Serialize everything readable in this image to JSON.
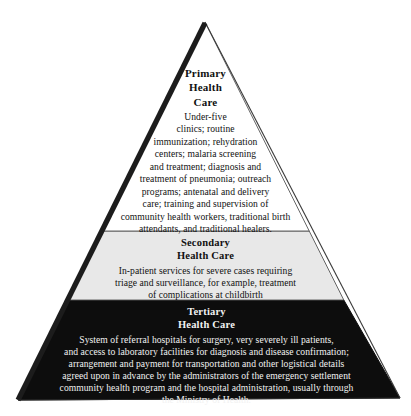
{
  "figure": {
    "name": "health-care-pyramid",
    "shape": "triangle-pyramid",
    "colors": {
      "primary_band_fill": "#ffffff",
      "secondary_band_fill": "#e8e8e8",
      "tertiary_band_fill": "#0d0d0d",
      "outline": "#3a3a3a",
      "left_edge_shadow": "#1a1a1a",
      "primary_text": "#111111",
      "secondary_text": "#111111",
      "tertiary_text": "#f2f2f2",
      "background": "#ffffff"
    },
    "geometry": {
      "apex_x": 205,
      "apex_y": 22,
      "base_left_x": 18,
      "base_right_x": 400,
      "base_y": 400,
      "band_boundary_primary_secondary_y": 231,
      "band_boundary_secondary_tertiary_y": 300
    }
  },
  "tiers": [
    {
      "id": "primary",
      "heading_lines": [
        "Primary",
        "Health",
        "Care"
      ],
      "body_lines": [
        "Under-five",
        "clinics; routine",
        "immunization; rehydration",
        "centers; malaria screening",
        "and treatment; diagnosis and",
        "treatment of pneumonia; outreach",
        "programs; antenatal and delivery",
        "care; training and supervision of",
        "community health workers, traditional birth",
        "attendants, and traditional healers."
      ]
    },
    {
      "id": "secondary",
      "heading_lines": [
        "Secondary",
        "Health Care"
      ],
      "body_lines": [
        "In-patient services for severe cases requiring",
        "triage and surveillance, for example, treatment",
        "of complications at childbirth"
      ]
    },
    {
      "id": "tertiary",
      "heading_lines": [
        "Tertiary",
        "Health Care"
      ],
      "body_lines": [
        "System of referral hospitals for surgery, very severely ill patients,",
        "and access to laboratory facilities for diagnosis and disease confirmation;",
        "arrangement and payment for transportation and other logistical details",
        "agreed upon in advance by the administrators of the emergency settlement",
        "community health program and the hospital administration, usually through",
        "the Ministry of Health."
      ]
    }
  ]
}
